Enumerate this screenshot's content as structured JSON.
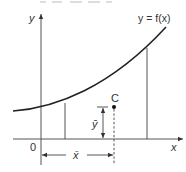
{
  "diagram": {
    "curve_label": "y = f(x)",
    "y_axis_label": "y",
    "x_axis_label": "x",
    "origin_label": "0",
    "centroid_label": "C",
    "x_bar_label": "x̄",
    "y_bar_label": "ȳ",
    "clipped_top_text": "",
    "colors": {
      "stroke": "#444444",
      "curve": "#222222",
      "text": "#333333",
      "background": "#ffffff"
    }
  }
}
